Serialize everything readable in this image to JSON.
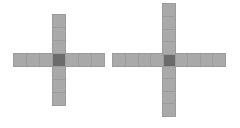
{
  "canvas": {
    "width": 240,
    "height": 128,
    "background": "#ffffff"
  },
  "colors": {
    "arm_cell": "#a9a9a9",
    "center_cell": "#6b6b6b",
    "cell_border": "#9c9c9c"
  },
  "crosses": [
    {
      "name": "small-cross",
      "center_x": 52,
      "center_y": 53,
      "cell_size": 13,
      "arm_length_cells": 3,
      "cell_w": 13.5,
      "cell_h": 14
    },
    {
      "name": "large-cross",
      "center_x": 162,
      "center_y": 53,
      "cell_size": 12.5,
      "arm_length_cells": 4,
      "cell_w": 14,
      "cell_h": 14
    }
  ]
}
